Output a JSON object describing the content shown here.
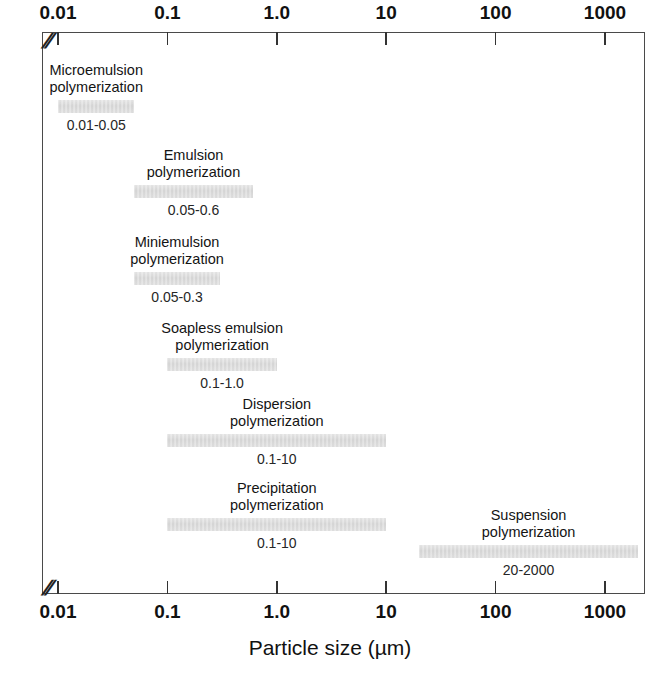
{
  "chart_data": {
    "type": "bar",
    "orientation": "horizontal",
    "title": "",
    "xlabel": "Particle size (µm)",
    "ylabel": "",
    "xscale": "log",
    "xlim": [
      0.008,
      2600
    ],
    "grid": false,
    "legend": null,
    "axis_break": true,
    "axis_break_symbol": "//",
    "tick_labels": [
      "0.01",
      "0.1",
      "1.0",
      "10",
      "100",
      "1000"
    ],
    "tick_values": [
      0.01,
      0.1,
      1.0,
      10,
      100,
      1000
    ],
    "axes_shown": [
      "top",
      "bottom"
    ],
    "bar_color": "#d4d4d4",
    "categories": [
      "Microemulsion polymerization",
      "Emulsion polymerization",
      "Miniemulsion polymerization",
      "Soapless emulsion polymerization",
      "Dispersion polymerization",
      "Precipitation polymerization",
      "Suspension polymerization"
    ],
    "series": [
      {
        "name": "Particle size range",
        "bars": [
          {
            "label_line1": "Microemulsion",
            "label_line2": "polymerization",
            "low": 0.01,
            "high": 0.05,
            "range_text": "0.01-0.05"
          },
          {
            "label_line1": "Emulsion",
            "label_line2": "polymerization",
            "low": 0.05,
            "high": 0.6,
            "range_text": "0.05-0.6"
          },
          {
            "label_line1": "Miniemulsion",
            "label_line2": "polymerization",
            "low": 0.05,
            "high": 0.3,
            "range_text": "0.05-0.3"
          },
          {
            "label_line1": "Soapless emulsion",
            "label_line2": "polymerization",
            "low": 0.1,
            "high": 1.0,
            "range_text": "0.1-1.0"
          },
          {
            "label_line1": "Dispersion",
            "label_line2": "polymerization",
            "low": 0.1,
            "high": 10,
            "range_text": "0.1-10"
          },
          {
            "label_line1": "Precipitation",
            "label_line2": "polymerization",
            "low": 0.1,
            "high": 10,
            "range_text": "0.1-10"
          },
          {
            "label_line1": "Suspension",
            "label_line2": "polymerization",
            "low": 20,
            "high": 2000,
            "range_text": "20-2000"
          }
        ]
      }
    ]
  },
  "axis": {
    "title": "Particle size (µm)",
    "break_symbol": "//"
  }
}
